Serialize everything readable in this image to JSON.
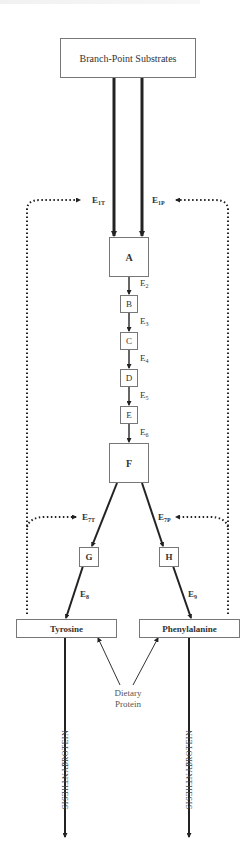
{
  "header": {
    "cropped_title": ""
  },
  "nodes": {
    "substrates": "Branch-Point Substrates",
    "A": "A",
    "B": "B",
    "C": "C",
    "D": "D",
    "E": "E",
    "F": "F",
    "G": "G",
    "H": "H",
    "tyrosine": "Tyrosine",
    "phenylalanine": "Phenylalanine",
    "dietary_protein_line1": "Dietary",
    "dietary_protein_line2": "Protein"
  },
  "enzymes": {
    "e1t": {
      "base": "E",
      "sub": "1T"
    },
    "e1p": {
      "base": "E",
      "sub": "1P"
    },
    "e2": {
      "base": "E",
      "sub": "2"
    },
    "e3": {
      "base": "E",
      "sub": "3"
    },
    "e4": {
      "base": "E",
      "sub": "4"
    },
    "e5": {
      "base": "E",
      "sub": "5"
    },
    "e6": {
      "base": "E",
      "sub": "6"
    },
    "e7t": {
      "base": "E",
      "sub": "7T"
    },
    "e7p": {
      "base": "E",
      "sub": "7P"
    },
    "e8": {
      "base": "E",
      "sub": "8"
    },
    "e9": {
      "base": "E",
      "sub": "9"
    }
  },
  "outputs": {
    "left_line1": "PROTEIN",
    "left_line2": "SYNTHESIS",
    "right_line1": "PROTEIN",
    "right_line2": "SYNTHESIS"
  },
  "colors": {
    "line": "#222222",
    "box_border": "#777777",
    "text": "#333333"
  }
}
